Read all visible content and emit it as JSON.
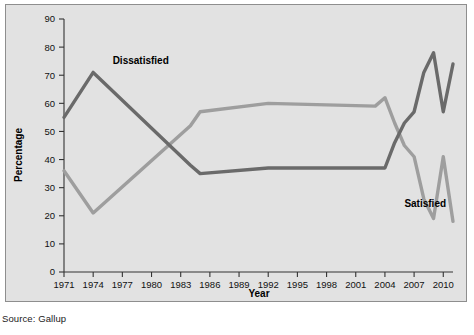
{
  "source_note": "Source: Gallup",
  "chart_data": {
    "type": "line",
    "title": "",
    "xlabel": "Year",
    "ylabel": "Percentage",
    "ylim": [
      0,
      90
    ],
    "ytick_step": 10,
    "yticks": [
      0,
      10,
      20,
      30,
      40,
      50,
      60,
      70,
      80,
      90
    ],
    "xlim": [
      1971,
      2011
    ],
    "xticks": [
      1971,
      1974,
      1977,
      1980,
      1983,
      1986,
      1989,
      1992,
      1995,
      1998,
      2001,
      2004,
      2007,
      2010
    ],
    "xtick_labels": [
      "1971",
      "1974",
      "1977",
      "1980",
      "1983",
      "1986",
      "1989",
      "1992",
      "1995",
      "1998",
      "2001",
      "2004",
      "2007",
      "2010"
    ],
    "grid": false,
    "legend_position": "inline-annotations",
    "background_color": "#e2e2e2",
    "series": [
      {
        "name": "Dissatisfied",
        "color": "#6a6a6a",
        "label_x": 1976,
        "label_y": 74,
        "x": [
          1971,
          1974,
          1984,
          1985,
          1992,
          2003,
          2004,
          2005,
          2006,
          2007,
          2008,
          2009,
          2010,
          2011
        ],
        "values": [
          55,
          71,
          38,
          35,
          37,
          37,
          37,
          46,
          53,
          57,
          71,
          78,
          57,
          74
        ]
      },
      {
        "name": "Satisfied",
        "color": "#9e9e9e",
        "label_x": 2006,
        "label_y": 23,
        "x": [
          1971,
          1974,
          1984,
          1985,
          1992,
          2003,
          2004,
          2005,
          2006,
          2007,
          2008,
          2009,
          2010,
          2011
        ],
        "values": [
          36,
          21,
          52,
          57,
          60,
          59,
          62,
          53,
          45,
          41,
          26,
          19,
          41,
          18
        ]
      }
    ],
    "dissatisfied_points": [
      {
        "year": 1971,
        "value": 55
      },
      {
        "year": 1974,
        "value": 71
      },
      {
        "year": 1984,
        "value": 38
      },
      {
        "year": 1985,
        "value": 35
      },
      {
        "year": 1992,
        "value": 37
      },
      {
        "year": 2003,
        "value": 37
      },
      {
        "year": 2004,
        "value": 37
      },
      {
        "year": 2005,
        "value": 46
      },
      {
        "year": 2006,
        "value": 53
      },
      {
        "year": 2007,
        "value": 57
      },
      {
        "year": 2008,
        "value": 71
      },
      {
        "year": 2009,
        "value": 78
      },
      {
        "year": 2010,
        "value": 57
      },
      {
        "year": 2011,
        "value": 74
      }
    ],
    "satisfied_points": [
      {
        "year": 1971,
        "value": 36
      },
      {
        "year": 1974,
        "value": 21
      },
      {
        "year": 1984,
        "value": 52
      },
      {
        "year": 1985,
        "value": 57
      },
      {
        "year": 1992,
        "value": 60
      },
      {
        "year": 2003,
        "value": 59
      },
      {
        "year": 2004,
        "value": 62
      },
      {
        "year": 2005,
        "value": 53
      },
      {
        "year": 2006,
        "value": 45
      },
      {
        "year": 2007,
        "value": 41
      },
      {
        "year": 2008,
        "value": 26
      },
      {
        "year": 2009,
        "value": 19
      },
      {
        "year": 2010,
        "value": 41
      },
      {
        "year": 2011,
        "value": 18
      }
    ]
  }
}
